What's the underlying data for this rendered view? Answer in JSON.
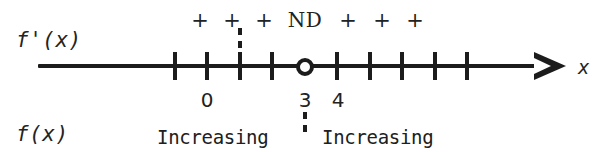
{
  "figure": {
    "type": "sign-chart",
    "variable_label": "x",
    "derivative_label": "f'(x)",
    "function_label": "f(x)"
  },
  "sign_row": {
    "items": [
      {
        "text": "+",
        "x": 200
      },
      {
        "text": "+",
        "x": 232
      },
      {
        "text": "+",
        "x": 264
      },
      {
        "text": "ND",
        "x": 305
      },
      {
        "text": "+",
        "x": 348
      },
      {
        "text": "+",
        "x": 382
      },
      {
        "text": "+",
        "x": 415
      }
    ]
  },
  "axis": {
    "ticks": [
      175,
      207,
      240,
      272,
      337,
      370,
      402,
      435,
      467
    ],
    "open_point_x": 305,
    "labels": [
      {
        "text": "0",
        "x": 207
      },
      {
        "text": "3",
        "x": 305
      },
      {
        "text": "4",
        "x": 338
      }
    ]
  },
  "dashes": [
    {
      "name": "critical-dash-upper",
      "x": 240,
      "top": 28,
      "height": 24
    },
    {
      "name": "undefined-dash-lower",
      "x": 305,
      "top": 112,
      "height": 26
    }
  ],
  "behavior_row": {
    "left": {
      "text": "Increasing",
      "x": 157
    },
    "right": {
      "text": "Increasing",
      "x": 322
    }
  },
  "chart_data": {
    "type": "table",
    "xlabel": "x",
    "rows": [
      {
        "name": "f'(x)",
        "intervals": [
          {
            "interval": "x < 3",
            "sign": "+"
          },
          {
            "interval": "x = 3",
            "sign": "ND"
          },
          {
            "interval": "x > 3",
            "sign": "+"
          }
        ]
      },
      {
        "name": "f(x)",
        "intervals": [
          {
            "interval": "x < 3",
            "behavior": "Increasing"
          },
          {
            "interval": "x > 3",
            "behavior": "Increasing"
          }
        ]
      }
    ],
    "marked_values": [
      0,
      3,
      4
    ],
    "undefined_at": 3
  }
}
